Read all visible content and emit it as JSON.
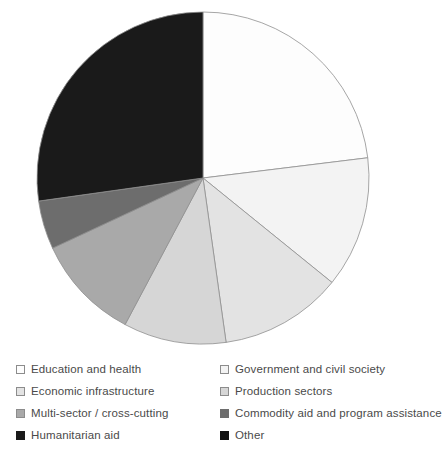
{
  "chart_data": {
    "type": "pie",
    "title": "",
    "subtitle": "",
    "legend_position": "bottom",
    "grid": false,
    "start_angle_deg": 0,
    "direction": "clockwise",
    "categories": [
      "Education and health",
      "Government and civil society",
      "Economic infrastructure",
      "Production sectors",
      "Multi-sector / cross-cutting",
      "Commodity aid and program assistance",
      "Humanitarian aid",
      "Other"
    ],
    "values": [
      23,
      13,
      12,
      10,
      10,
      5,
      27,
      0
    ],
    "units": "percent",
    "slices": [
      {
        "label": "Education and health",
        "value": 23,
        "color": "#fdfdfd",
        "start_deg": 0,
        "end_deg": 83
      },
      {
        "label": "Government and civil society",
        "value": 13,
        "color": "#f3f3f3",
        "start_deg": 83,
        "end_deg": 129
      },
      {
        "label": "Economic infrastructure",
        "value": 12,
        "color": "#e3e3e3",
        "start_deg": 129,
        "end_deg": 172
      },
      {
        "label": "Production sectors",
        "value": 10,
        "color": "#d6d6d6",
        "start_deg": 172,
        "end_deg": 208
      },
      {
        "label": "Multi-sector / cross-cutting",
        "value": 10,
        "color": "#a9a9a9",
        "start_deg": 208,
        "end_deg": 245
      },
      {
        "label": "Commodity aid and program assistance",
        "value": 5,
        "color": "#6d6d6d",
        "start_deg": 245,
        "end_deg": 262
      },
      {
        "label": "Humanitarian aid",
        "value": 27,
        "color": "#1a1a1a",
        "start_deg": 262,
        "end_deg": 360
      },
      {
        "label": "Other",
        "value": 0,
        "color": "#111111",
        "start_deg": 360,
        "end_deg": 360
      }
    ],
    "geometry": {
      "center_x": 203,
      "center_y": 178,
      "radius": 166
    },
    "stroke_color": "#8f8f8f"
  },
  "legend": {
    "items": [
      {
        "label": "Education and health",
        "color": "#fdfdfd",
        "border": "#8c8c8c",
        "name": "education-and-health"
      },
      {
        "label": "Government and civil society",
        "color": "#f3f3f3",
        "border": "#8c8c8c",
        "name": "government-and-civil-society"
      },
      {
        "label": "Economic infrastructure",
        "color": "#e3e3e3",
        "border": "#8c8c8c",
        "name": "economic-infrastructure"
      },
      {
        "label": "Production sectors",
        "color": "#d6d6d6",
        "border": "#8c8c8c",
        "name": "production-sectors"
      },
      {
        "label": "Multi-sector / cross-cutting",
        "color": "#a9a9a9",
        "border": "#8c8c8c",
        "name": "multi-sector-cross-cutting"
      },
      {
        "label": "Commodity aid and program assistance",
        "color": "#6d6d6d",
        "border": "#6d6d6d",
        "name": "commodity-aid-and-program-assistance"
      },
      {
        "label": "Humanitarian aid",
        "color": "#1a1a1a",
        "border": "#1a1a1a",
        "name": "humanitarian-aid"
      },
      {
        "label": "Other",
        "color": "#111111",
        "border": "#111111",
        "name": "other"
      }
    ],
    "column_order": [
      0,
      1,
      2,
      3,
      4,
      5,
      6,
      7
    ]
  },
  "colors": {
    "background": "#ffffff",
    "text": "#4a4a4a",
    "slice_outline": "#8f8f8f"
  }
}
